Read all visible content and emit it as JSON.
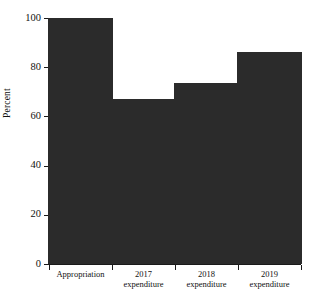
{
  "chart_data": {
    "type": "bar",
    "title": "",
    "xlabel": "",
    "ylabel": "Percent",
    "categories": [
      "Appropriation",
      "2017\nexpenditure",
      "2018\nexpenditure",
      "2019\nexpenditure"
    ],
    "values": [
      100,
      67,
      73.5,
      86
    ],
    "ylim": [
      0,
      100
    ],
    "yticks": [
      0,
      20,
      40,
      60,
      80,
      100
    ],
    "ytick_labels": [
      "0",
      "20",
      "40",
      "60",
      "80",
      "100"
    ],
    "grid": false,
    "legend": false,
    "bar_color": "#2b2b2b",
    "axis_color": "#1a1a1a",
    "background_color": "#ffffff"
  },
  "axis": {
    "y_title": "Percent"
  }
}
